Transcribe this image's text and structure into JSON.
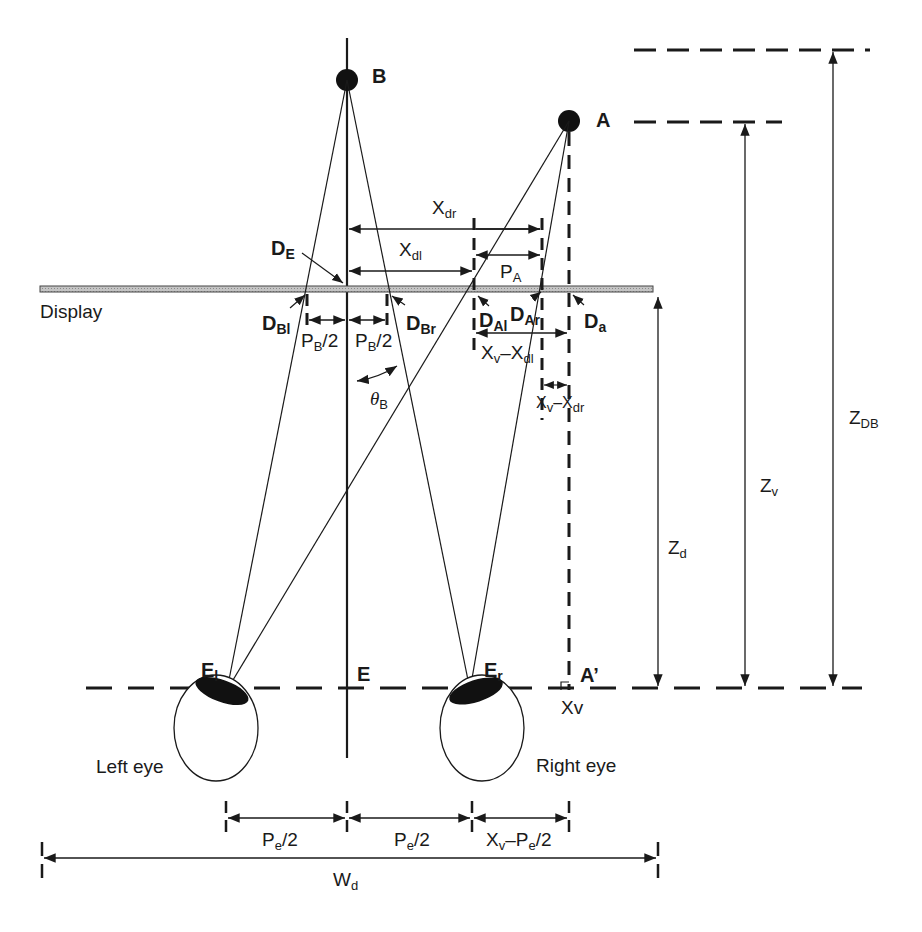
{
  "figure": {
    "points": {
      "B": "B",
      "A": "A",
      "A_prime": "A’"
    },
    "display_label": "Display",
    "display_points": {
      "DE": {
        "main": "D",
        "sub": "E"
      },
      "DBl": {
        "main": "D",
        "sub": "Bl"
      },
      "DBr": {
        "main": "D",
        "sub": "Br"
      },
      "DAl": {
        "main": "D",
        "sub": "Al"
      },
      "DAr": {
        "main": "D",
        "sub": "Ar"
      },
      "Da": {
        "main": "D",
        "sub": "a"
      }
    },
    "eye_points": {
      "El": {
        "main": "E",
        "sub": "l"
      },
      "E": "E",
      "Er": {
        "main": "E",
        "sub": "r"
      }
    },
    "eyes": {
      "left": "Left eye",
      "right": "Right eye"
    },
    "dimensions": {
      "Xdr": {
        "main": "X",
        "sub": "dr"
      },
      "Xdl": {
        "main": "X",
        "sub": "dl"
      },
      "PA": {
        "main": "P",
        "sub": "A"
      },
      "PB2_left": {
        "main": "P",
        "sub": "B",
        "tail": "/2"
      },
      "PB2_right": {
        "main": "P",
        "sub": "B",
        "tail": "/2"
      },
      "thetaB": {
        "main": "θ",
        "sub": "B"
      },
      "Xv_minus_Xdl": {
        "a": "X",
        "a_sub": "v",
        "mid": "–X",
        "b_sub": "dl"
      },
      "Xv_minus_Xdr": {
        "a": "X",
        "a_sub": "v",
        "mid": "–X",
        "b_sub": "dr"
      },
      "Zd": {
        "main": "Z",
        "sub": "d"
      },
      "Zv": {
        "main": "Z",
        "sub": "v"
      },
      "ZDB": {
        "main": "Z",
        "sub": "DB"
      },
      "Xv": "Xv",
      "Pe2_left": {
        "main": "P",
        "sub": "e",
        "tail": "/2"
      },
      "Pe2_right": {
        "main": "P",
        "sub": "e",
        "tail": "/2"
      },
      "Xv_minus_Pe2": {
        "a": "X",
        "a_sub": "v",
        "mid": "–P",
        "b_sub": "e",
        "tail": "/2"
      },
      "Wd": {
        "main": "W",
        "sub": "d"
      }
    },
    "colors": {
      "ink": "#1a1a1a",
      "display_fill": "#b8b8b8"
    }
  }
}
